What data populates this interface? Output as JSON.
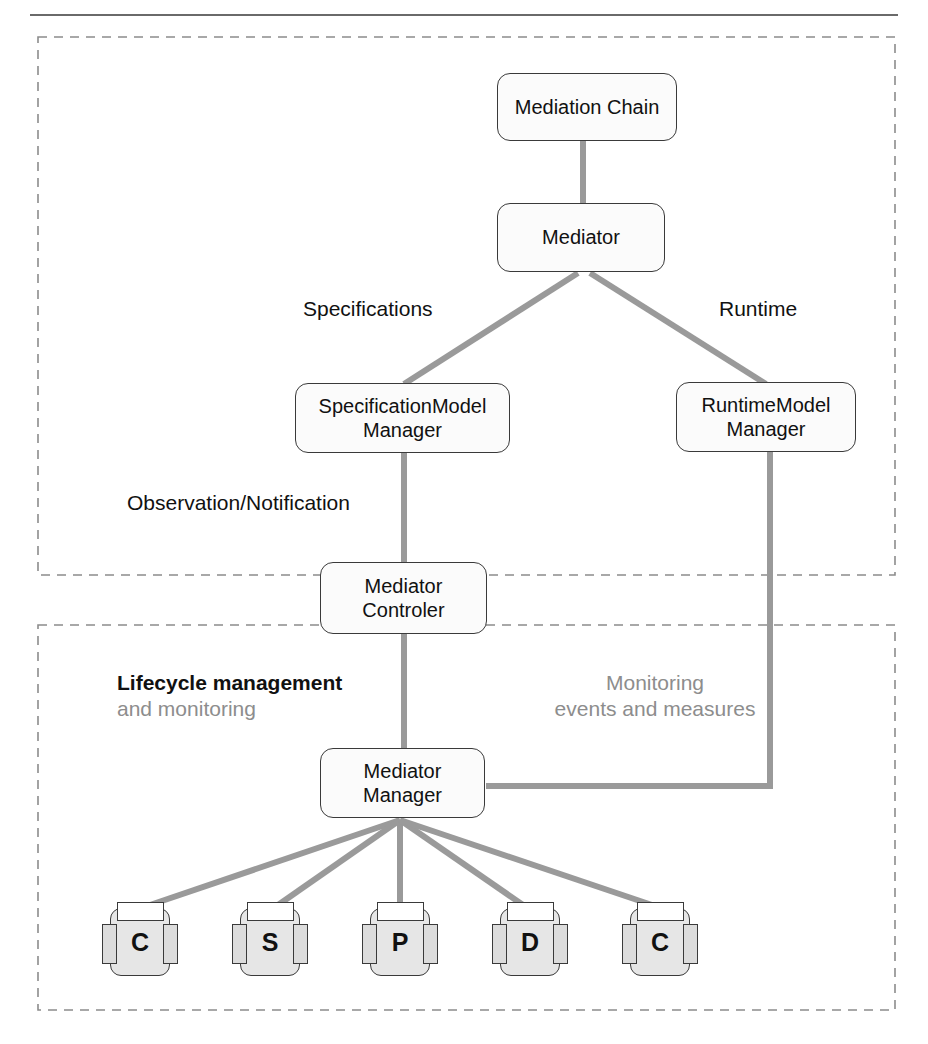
{
  "diagram": {
    "colors": {
      "connector": "#9a9a9a",
      "node_border": "#3a3a3a",
      "node_fill": "#fbfbfb",
      "frame_dash": "#8c8c8c",
      "text": "#111111",
      "text_gray": "#8d8d8d",
      "component_fill": "#e6e6e6"
    },
    "frames": [
      {
        "name": "upper-frame",
        "x": 38,
        "y": 37,
        "width": 857,
        "height": 538
      },
      {
        "name": "lower-frame",
        "x": 38,
        "y": 625,
        "width": 857,
        "height": 385
      }
    ],
    "nodes": {
      "mediation_chain": {
        "label": "Mediation Chain",
        "x": 497,
        "y": 73,
        "w": 180,
        "h": 68
      },
      "mediator": {
        "label": "Mediator",
        "x": 497,
        "y": 203,
        "w": 168,
        "h": 69
      },
      "specification_model_manager": {
        "line1": "SpecificationModel",
        "line2": "Manager",
        "x": 295,
        "y": 383,
        "w": 215,
        "h": 70
      },
      "runtime_model_manager": {
        "line1": "RuntimeModel",
        "line2": "Manager",
        "x": 676,
        "y": 382,
        "w": 180,
        "h": 70
      },
      "mediator_controler": {
        "line1": "Mediator",
        "line2": "Controler",
        "x": 320,
        "y": 562,
        "w": 167,
        "h": 72
      },
      "mediator_manager": {
        "line1": "Mediator",
        "line2": "Manager",
        "x": 320,
        "y": 748,
        "w": 165,
        "h": 70
      }
    },
    "edge_labels": {
      "specifications": "Specifications",
      "runtime": "Runtime",
      "observation_notification": "Observation/Notification",
      "lifecycle_strong": "Lifecycle management",
      "lifecycle_soft": "and monitoring",
      "monitoring_line1": "Monitoring",
      "monitoring_line2": "events and measures"
    },
    "components": [
      {
        "label": "C",
        "name": "component-c-1",
        "cx": 140
      },
      {
        "label": "S",
        "name": "component-s",
        "cx": 270
      },
      {
        "label": "P",
        "name": "component-p",
        "cx": 400
      },
      {
        "label": "D",
        "name": "component-d",
        "cx": 530
      },
      {
        "label": "C",
        "name": "component-c-2",
        "cx": 660
      }
    ]
  }
}
